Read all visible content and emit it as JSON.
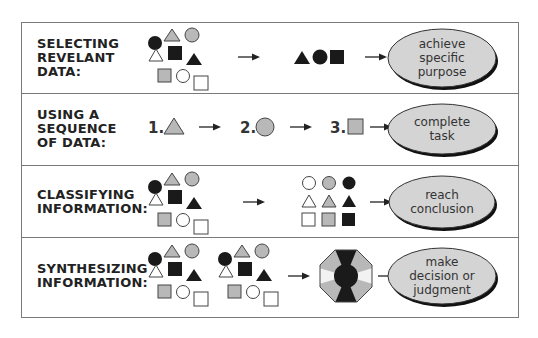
{
  "header": {
    "fragment_text": "… using a …"
  },
  "rows": [
    {
      "label_lines": [
        "SELECTING",
        "REVELANT",
        "DATA:"
      ],
      "input": "scattered-shapes",
      "intermediate": [
        "black-triangle",
        "black-circle",
        "black-square"
      ],
      "outcome_lines": [
        "achieve",
        "specific",
        "purpose"
      ]
    },
    {
      "label_lines": [
        "USING A",
        "SEQUENCE",
        "OF DATA:"
      ],
      "steps": [
        {
          "number": "1.",
          "shape": "gray-triangle"
        },
        {
          "number": "2.",
          "shape": "gray-circle"
        },
        {
          "number": "3.",
          "shape": "gray-square"
        }
      ],
      "outcome_lines": [
        "complete",
        "task"
      ]
    },
    {
      "label_lines": [
        "CLASSIFYING",
        "INFORMATION:"
      ],
      "input": "scattered-shapes",
      "intermediate": "3x3 grid: columns white / gray / black; rows circle / triangle / square",
      "outcome_lines": [
        "reach",
        "conclusion"
      ]
    },
    {
      "label_lines": [
        "SYNTHESIZING",
        "INFORMATION:"
      ],
      "input": "two sets of scattered-shapes",
      "intermediate": "octagon combining gray, white, black segments with black center circle",
      "outcome_lines": [
        "make",
        "decision or",
        "judgment"
      ]
    }
  ],
  "colors": {
    "gray_fill": "#b8b8b8",
    "black_fill": "#1a1a1a",
    "oval_fill": "#d4d4d4",
    "border": "#7a7a7a"
  }
}
